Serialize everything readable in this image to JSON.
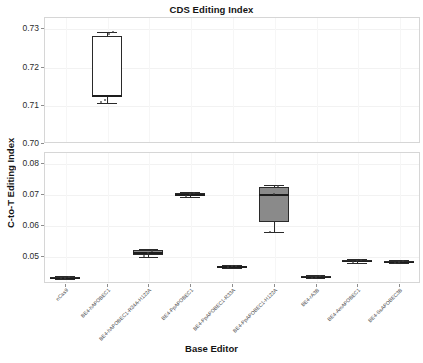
{
  "chart_data": {
    "type": "box",
    "title": "CDS Editing Index",
    "xlabel": "Base Editor",
    "ylabel": "C-to-T Editing Index",
    "grid": true,
    "legend": "none",
    "panels": [
      {
        "name": "upper",
        "ylim": [
          0.7,
          0.733
        ],
        "yticks": [
          "0.70",
          "0.71",
          "0.72",
          "0.73"
        ],
        "ytick_values": [
          0.7,
          0.71,
          0.72,
          0.73
        ]
      },
      {
        "name": "lower",
        "ylim": [
          0.0415,
          0.0835
        ],
        "yticks": [
          "0.05",
          "0.06",
          "0.07",
          "0.08"
        ],
        "ytick_values": [
          0.05,
          0.06,
          0.07,
          0.08
        ]
      }
    ],
    "categories": [
      "nCas9",
      "BE4-hAPOBEC1",
      "BE4-hAPOBEC1-R34A-H122A",
      "BE4-PpAPOBEC1",
      "BE4-PpAPOBEC1-R33A",
      "BE4-PpAPOBEC1-H122A",
      "BE4-rA3B",
      "BE4-AmAPOBEC1",
      "BE4-SsAPOBEC3B"
    ],
    "boxes": [
      {
        "category": "nCas9",
        "panel": "lower",
        "fill": "#3a3a3a",
        "min": 0.0428,
        "q1": 0.043,
        "median": 0.0432,
        "q3": 0.0434,
        "max": 0.0436,
        "points": [
          0.043,
          0.0432,
          0.0434
        ]
      },
      {
        "category": "BE4-hAPOBEC1",
        "panel": "upper",
        "fill": "#ffffff",
        "min": 0.7105,
        "q1": 0.712,
        "median": 0.7125,
        "q3": 0.728,
        "max": 0.729,
        "points": [
          0.7108,
          0.7112,
          0.7285,
          0.7292
        ]
      },
      {
        "category": "BE4-hAPOBEC1-R34A-H122A",
        "panel": "lower",
        "fill": "#8e8e8e",
        "min": 0.0497,
        "q1": 0.0505,
        "median": 0.0513,
        "q3": 0.052,
        "max": 0.0524,
        "points": [
          0.05,
          0.0512,
          0.0519
        ]
      },
      {
        "category": "BE4-PpAPOBEC1",
        "panel": "lower",
        "fill": "#9a9a9a",
        "min": 0.069,
        "q1": 0.0694,
        "median": 0.0699,
        "q3": 0.0703,
        "max": 0.0706,
        "points": [
          0.0693,
          0.07,
          0.0704
        ]
      },
      {
        "category": "BE4-PpAPOBEC1-R33A",
        "panel": "lower",
        "fill": "#4a4a4a",
        "min": 0.0464,
        "q1": 0.0466,
        "median": 0.0468,
        "q3": 0.047,
        "max": 0.0472,
        "points": [
          0.0466,
          0.0468,
          0.047
        ]
      },
      {
        "category": "BE4-PpAPOBEC1-H122A",
        "panel": "lower",
        "fill": "#8a8a8a",
        "min": 0.0578,
        "q1": 0.061,
        "median": 0.07,
        "q3": 0.0722,
        "max": 0.073,
        "points": [
          0.058,
          0.07,
          0.0726
        ]
      },
      {
        "category": "BE4-rA3B",
        "panel": "lower",
        "fill": "#3a3a3a",
        "min": 0.043,
        "q1": 0.0433,
        "median": 0.0435,
        "q3": 0.0438,
        "max": 0.044,
        "points": [
          0.0432,
          0.0435,
          0.0438
        ]
      },
      {
        "category": "BE4-AmAPOBEC1",
        "panel": "lower",
        "fill": "#5a5a5a",
        "min": 0.0478,
        "q1": 0.0482,
        "median": 0.0486,
        "q3": 0.0489,
        "max": 0.0492,
        "points": [
          0.0481,
          0.0486,
          0.049
        ]
      },
      {
        "category": "BE4-SsAPOBEC3B",
        "panel": "lower",
        "fill": "#4a4a4a",
        "min": 0.0478,
        "q1": 0.0481,
        "median": 0.0483,
        "q3": 0.0485,
        "max": 0.0488,
        "points": [
          0.048,
          0.0483,
          0.0486
        ]
      }
    ]
  }
}
